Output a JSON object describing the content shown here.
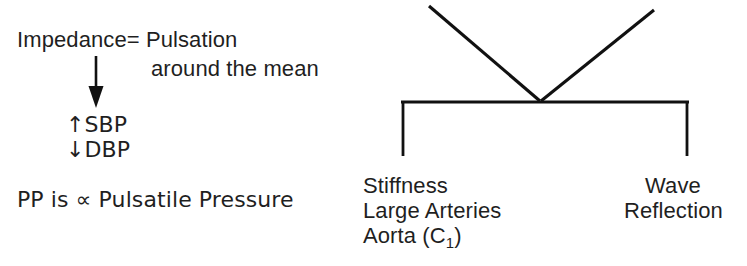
{
  "figure": {
    "background_color": "#ffffff",
    "ink_color": "#1f1f1f",
    "line_color": "#111111"
  },
  "left_panel": {
    "impedance_line": "Impedance= Pulsation",
    "around_mean_line": "around the mean",
    "sbp_line": "↑SBP",
    "dbp_line": "↓DBP",
    "pp_line": "PP is ∝ Pulsatile Pressure",
    "down_arrow": "down-arrow-connector"
  },
  "right_panel": {
    "bracket": "bracket-connector",
    "v_converge": "v-converging-lines",
    "left_branch": {
      "line_1": "Stiffness",
      "line_2": "Large Arteries",
      "line_3_prefix": "Aorta (C",
      "line_3_subscript": "1",
      "line_3_suffix": ")"
    },
    "right_branch": {
      "line_1": "Wave",
      "line_2": "Reflection"
    }
  }
}
